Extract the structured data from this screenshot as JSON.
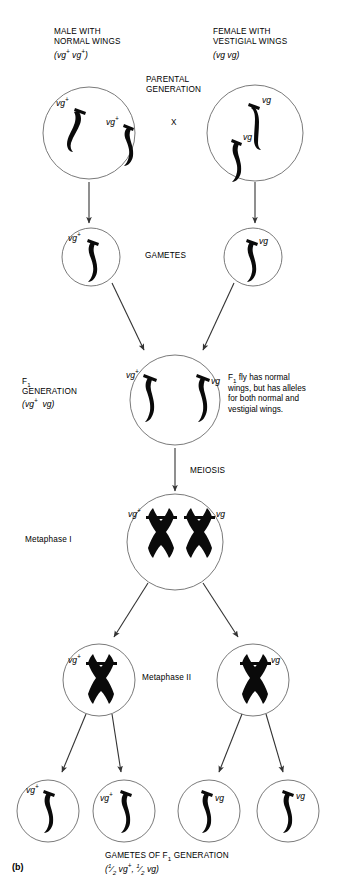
{
  "figure": {
    "panel_label": "(b)",
    "title_left": "MALE WITH\nNORMAL WINGS",
    "title_left_genotype": "(vg+ vg+)",
    "title_right": "FEMALE WITH\nVESTIGIAL WINGS",
    "title_right_genotype": "(vg vg)",
    "parental_label": "PARENTAL\nGENERATION",
    "cross_symbol": "X",
    "gametes_label": "GAMETES",
    "f1_label": "F1\nGENERATION",
    "f1_genotype": "(vg+ vg)",
    "f1_note": "F1 fly has normal\nwings, but has alleles\nfor both normal and\nvestigial wings.",
    "meiosis_label": "MEIOSIS",
    "metaphase_i_label": "Metaphase I",
    "metaphase_ii_label": "Metaphase II",
    "bottom_caption": "GAMETES OF F1 GENERATION",
    "bottom_caption_ratio": "(1/2 vg+, 1/2 vg)"
  },
  "alleles": {
    "normal": "vg",
    "normal_sup": "+",
    "vestigial": "vg"
  },
  "cells": {
    "parent_male": {
      "name": "parental-male-cell",
      "alleles": [
        "vg+",
        "vg+"
      ]
    },
    "parent_female": {
      "name": "parental-female-cell",
      "alleles": [
        "vg",
        "vg"
      ]
    },
    "gamete_male": {
      "name": "male-gamete-cell",
      "alleles": [
        "vg+"
      ]
    },
    "gamete_female": {
      "name": "female-gamete-cell",
      "alleles": [
        "vg"
      ]
    },
    "f1": {
      "name": "f1-zygote-cell",
      "alleles": [
        "vg+",
        "vg"
      ]
    },
    "metaphase_i": {
      "name": "metaphase-i-cell",
      "alleles": [
        "vg+",
        "vg"
      ]
    },
    "metaphase_ii_left": {
      "name": "metaphase-ii-left-cell",
      "alleles": [
        "vg+"
      ]
    },
    "metaphase_ii_right": {
      "name": "metaphase-ii-right-cell",
      "alleles": [
        "vg"
      ]
    },
    "f1_gametes": [
      {
        "name": "f1-gamete-1",
        "allele": "vg+"
      },
      {
        "name": "f1-gamete-2",
        "allele": "vg+"
      },
      {
        "name": "f1-gamete-3",
        "allele": "vg"
      },
      {
        "name": "f1-gamete-4",
        "allele": "vg"
      }
    ]
  },
  "colors": {
    "background": "#ffffff",
    "ink": "#000000",
    "cell_outline": "#595959",
    "arrow": "#333333"
  }
}
